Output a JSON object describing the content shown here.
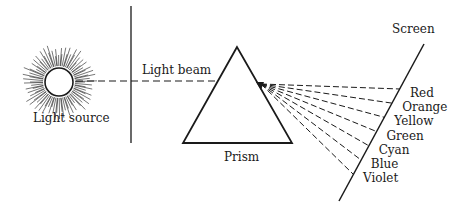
{
  "labels": {
    "light_source": "Light source",
    "light_beam": "Light beam",
    "prism": "Prism",
    "screen": "Screen"
  },
  "spectrum": [
    "Red",
    "Orange",
    "Yellow",
    "Green",
    "Cyan",
    "Blue",
    "Violet"
  ],
  "colors": {
    "ink": "#1a1a1a",
    "background": "#ffffff"
  }
}
